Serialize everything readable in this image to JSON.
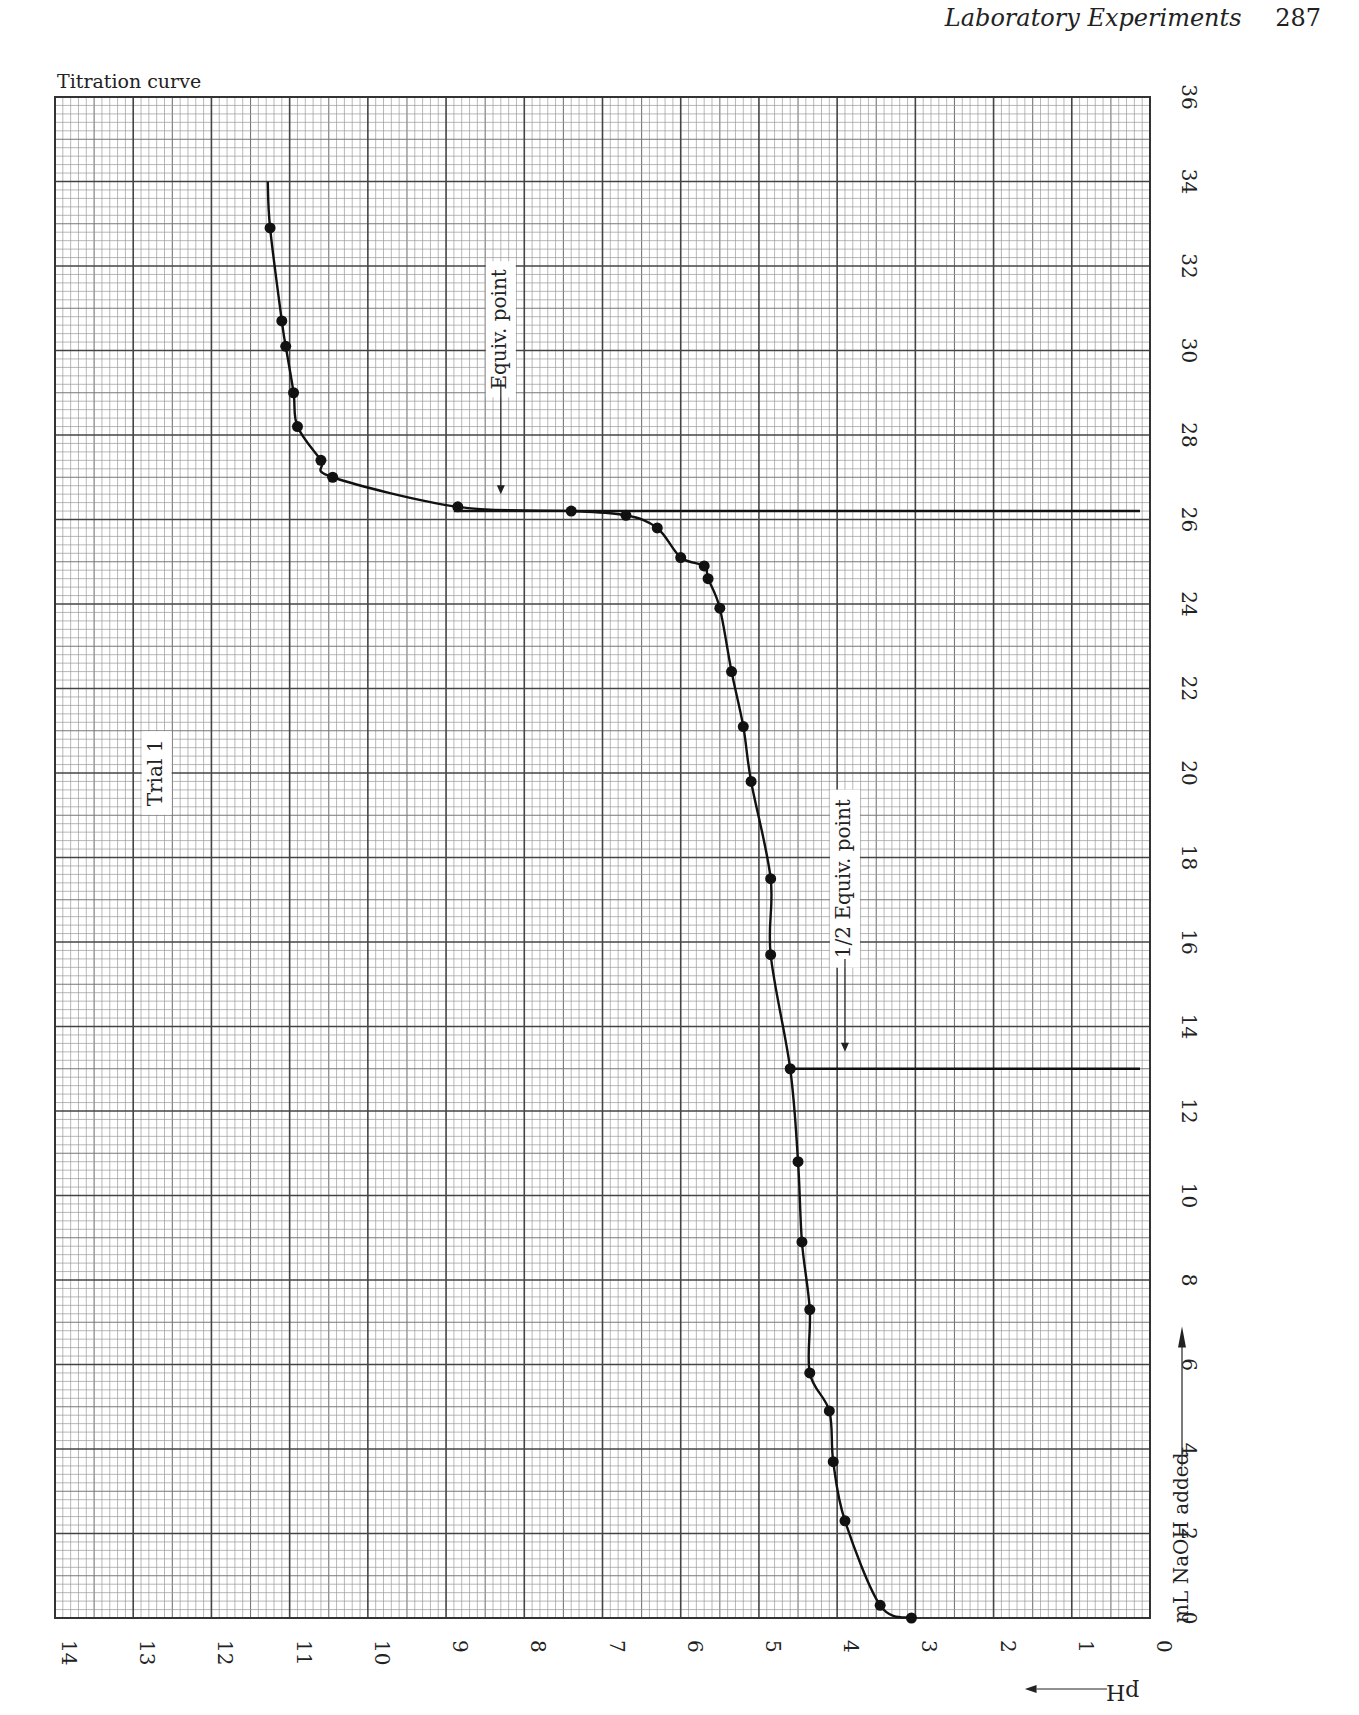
{
  "page": {
    "running_head": "Laboratory Experiments",
    "page_number": "287",
    "figure_title": "Titration curve"
  },
  "chart_data": {
    "type": "scatter",
    "title": "Titration curve",
    "orientation": "rotated 90° (pH on horizontal axis increasing right-to-left, mL NaOH on vertical axis increasing bottom-to-top)",
    "xlabel": "pH",
    "ylabel": "mL NaOH added",
    "xlim": [
      0,
      14
    ],
    "ylim": [
      0,
      36
    ],
    "x_ticks": [
      "0",
      "1",
      "2",
      "3",
      "4",
      "5",
      "6",
      "7",
      "8",
      "9",
      "10",
      "11",
      "12",
      "13",
      "14"
    ],
    "y_ticks": [
      "0",
      "2",
      "4",
      "6",
      "8",
      "10",
      "12",
      "14",
      "16",
      "18",
      "20",
      "22",
      "24",
      "26",
      "28",
      "30",
      "32",
      "34",
      "36"
    ],
    "grid": true,
    "grid_minor_divisions": 10,
    "series": [
      {
        "name": "Trial 1",
        "marker": "filled circle",
        "points": [
          {
            "ml": 0.0,
            "ph": 3.05
          },
          {
            "ml": 0.3,
            "ph": 3.45
          },
          {
            "ml": 2.3,
            "ph": 3.9
          },
          {
            "ml": 3.7,
            "ph": 4.05
          },
          {
            "ml": 4.9,
            "ph": 4.1
          },
          {
            "ml": 5.8,
            "ph": 4.35
          },
          {
            "ml": 7.3,
            "ph": 4.35
          },
          {
            "ml": 8.9,
            "ph": 4.45
          },
          {
            "ml": 10.8,
            "ph": 4.5
          },
          {
            "ml": 13.0,
            "ph": 4.6
          },
          {
            "ml": 15.7,
            "ph": 4.85
          },
          {
            "ml": 17.5,
            "ph": 4.85
          },
          {
            "ml": 19.8,
            "ph": 5.1
          },
          {
            "ml": 21.1,
            "ph": 5.2
          },
          {
            "ml": 22.4,
            "ph": 5.35
          },
          {
            "ml": 23.9,
            "ph": 5.5
          },
          {
            "ml": 24.6,
            "ph": 5.65
          },
          {
            "ml": 24.9,
            "ph": 5.7
          },
          {
            "ml": 25.1,
            "ph": 6.0
          },
          {
            "ml": 25.8,
            "ph": 6.3
          },
          {
            "ml": 26.1,
            "ph": 6.7
          },
          {
            "ml": 26.2,
            "ph": 7.4
          },
          {
            "ml": 26.3,
            "ph": 8.85
          },
          {
            "ml": 27.0,
            "ph": 10.45
          },
          {
            "ml": 27.4,
            "ph": 10.6
          },
          {
            "ml": 28.2,
            "ph": 10.9
          },
          {
            "ml": 29.0,
            "ph": 10.95
          },
          {
            "ml": 30.1,
            "ph": 11.05
          },
          {
            "ml": 30.7,
            "ph": 11.1
          },
          {
            "ml": 32.9,
            "ph": 11.25
          }
        ]
      }
    ],
    "reference_lines": [
      {
        "label": "Equiv. point",
        "ml": 26.2,
        "ph_from": 0,
        "ph_to": 8.9
      },
      {
        "label": "1/2 Equiv. point",
        "ml": 13.0,
        "ph_from": 0,
        "ph_to": 4.6
      }
    ],
    "annotations": [
      {
        "text": "Equiv. point",
        "ph": 8.3,
        "ml": 30.5,
        "rotated": true
      },
      {
        "text": "1/2 Equiv. point",
        "ph": 3.9,
        "ml": 17.5,
        "rotated": true
      },
      {
        "text": "Trial 1",
        "ph": 12.7,
        "ml": 20.0,
        "rotated": true
      }
    ],
    "axis_arrows": {
      "ph_direction": "←",
      "ml_direction": "→"
    }
  }
}
